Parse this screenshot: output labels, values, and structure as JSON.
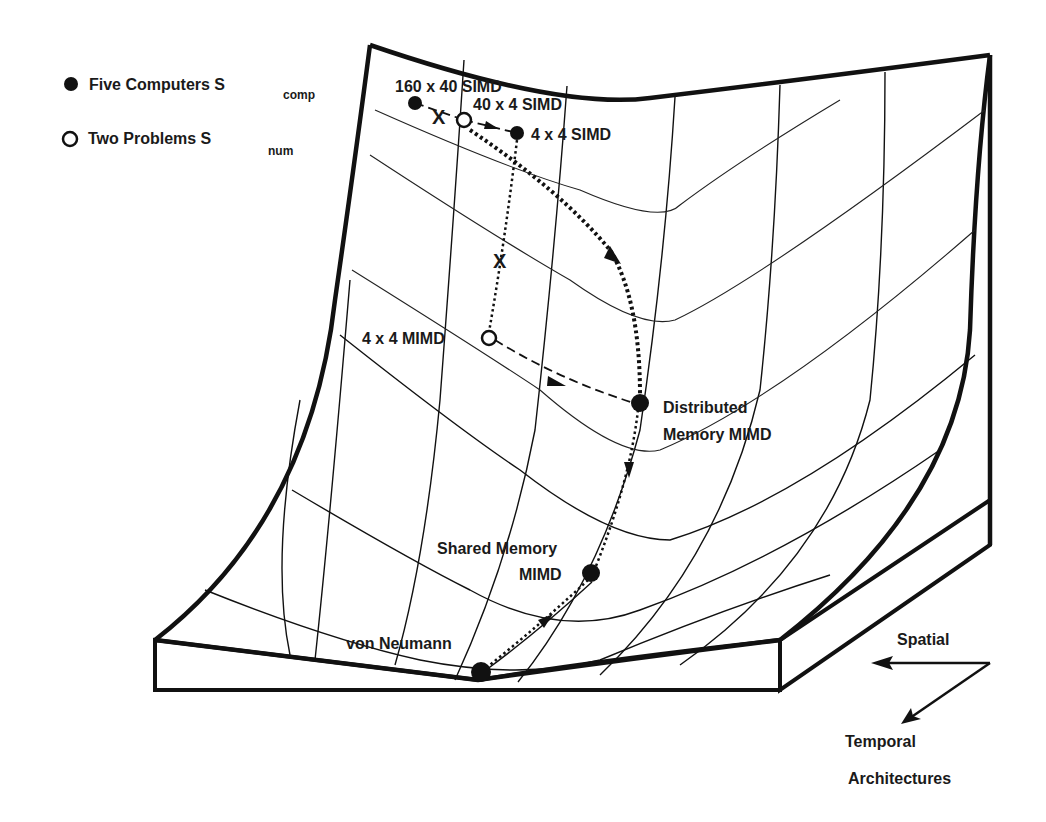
{
  "legend": {
    "items": [
      {
        "marker": "filled-circle",
        "label": "Five Computers S",
        "subscript": "comp"
      },
      {
        "marker": "open-circle",
        "label": "Two Problems S",
        "subscript": "num"
      }
    ]
  },
  "points": {
    "computers": [
      {
        "label": "160 x 40 SIMD",
        "x": 415,
        "y": 103
      },
      {
        "label": "4 x 4 SIMD",
        "x": 517,
        "y": 133
      },
      {
        "label": "Distributed",
        "label2": "Memory MIMD",
        "x": 640,
        "y": 403
      },
      {
        "label": "Shared Memory",
        "label2": "MIMD",
        "x": 591,
        "y": 573
      },
      {
        "label": "von Neumann",
        "x": 481,
        "y": 672
      }
    ],
    "problems": [
      {
        "label": "40 x 4 SIMD",
        "x": 464,
        "y": 120
      },
      {
        "label": "4 x 4 MIMD",
        "x": 489,
        "y": 338
      }
    ],
    "x_marks": [
      {
        "symbol": "X",
        "x": 440,
        "y": 116
      },
      {
        "symbol": "X",
        "x": 501,
        "y": 261
      }
    ]
  },
  "axes": {
    "spatial": "Spatial",
    "temporal": "Temporal",
    "caption": "Architectures"
  },
  "colors": {
    "ink": "#111111",
    "background": "#ffffff"
  }
}
